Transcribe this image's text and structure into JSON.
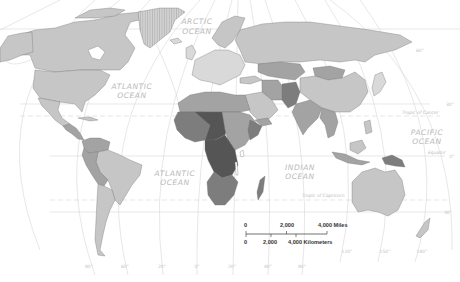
{
  "map": {
    "type": "choropleth world map",
    "colors": {
      "ocean": "#ffffff",
      "lightest": "#d9d9d9",
      "light": "#c6c6c6",
      "medium": "#a3a3a3",
      "dark": "#7d7d7d",
      "darkest": "#555555",
      "greenland_hatch": "#c9c9c9"
    },
    "ocean_labels": [
      {
        "line1": "ARCTIC",
        "line2": "OCEAN"
      },
      {
        "line1": "ATLANTIC",
        "line2": "OCEAN"
      },
      {
        "line1": "ATLANTIC",
        "line2": "OCEAN"
      },
      {
        "line1": "INDIAN",
        "line2": "OCEAN"
      },
      {
        "line1": "PACIFIC",
        "line2": "OCEAN"
      }
    ],
    "line_labels": {
      "tropic_cancer": "Tropic of Cancer",
      "equator": "Equator",
      "tropic_capricorn": "Tropic of Capricorn"
    },
    "latitude_labels": [
      "60°",
      "30°",
      "0°",
      "30°"
    ],
    "longitude_labels": [
      "80°",
      "60°",
      "20°",
      "0°",
      "20°",
      "40°",
      "80°",
      "120°",
      "150°",
      "180°"
    ],
    "scale": {
      "miles_ticks": [
        "0",
        "2,000",
        "4,000 Miles"
      ],
      "km_ticks": [
        "0",
        "2,000",
        "4,000 Kilometers"
      ]
    }
  }
}
